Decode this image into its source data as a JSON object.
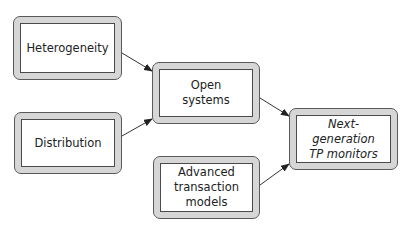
{
  "diagram": {
    "nodes": [
      {
        "id": "heterogeneity",
        "label": "Heterogeneity",
        "italic": false
      },
      {
        "id": "distribution",
        "label": "Distribution",
        "italic": false
      },
      {
        "id": "open-systems",
        "label": "Open\nsystems",
        "italic": false
      },
      {
        "id": "advanced-transaction-models",
        "label": "Advanced\ntransaction\nmodels",
        "italic": false
      },
      {
        "id": "next-generation-tp-monitors",
        "label": "Next-generation\nTP monitors",
        "italic": true
      }
    ],
    "edges": [
      {
        "from": "heterogeneity",
        "to": "open-systems"
      },
      {
        "from": "distribution",
        "to": "open-systems"
      },
      {
        "from": "open-systems",
        "to": "next-generation-tp-monitors"
      },
      {
        "from": "advanced-transaction-models",
        "to": "next-generation-tp-monitors"
      }
    ]
  }
}
